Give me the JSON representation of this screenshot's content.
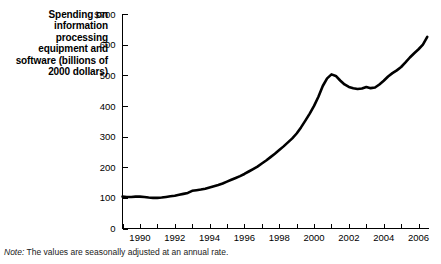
{
  "chart_title": "Spending on information processing equipment and software (billions of 2000 dollars)",
  "note": {
    "label": "Note:",
    "text": " The values are seasonally adjusted at an annual rate."
  },
  "colors": {
    "line": "#000000",
    "axis": "#000000",
    "background": "#ffffff"
  },
  "chart_data": {
    "type": "line",
    "title": "Spending on information processing equipment and software (billions of 2000 dollars)",
    "xlabel": "",
    "ylabel": "Spending on information processing equipment and software (billions of 2000 dollars)",
    "xlim": [
      1989.0,
      2006.6
    ],
    "ylim": [
      0,
      700
    ],
    "grid": false,
    "legend": null,
    "y_ticks": [
      0,
      100,
      200,
      300,
      400,
      500,
      600,
      700
    ],
    "y_tick_labels": [
      "0",
      "100",
      "200",
      "300",
      "400",
      "500",
      "600",
      "$700"
    ],
    "x_ticks": [
      1989,
      1990,
      1991,
      1992,
      1993,
      1994,
      1995,
      1996,
      1997,
      1998,
      1999,
      2000,
      2001,
      2002,
      2003,
      2004,
      2005,
      2006
    ],
    "x_tick_labels": [
      "",
      "1990",
      "",
      "1992",
      "",
      "1994",
      "",
      "1996",
      "",
      "1998",
      "",
      "2000",
      "",
      "2002",
      "",
      "2004",
      "",
      "2006"
    ],
    "series": [
      {
        "name": "Spending on information processing equipment and software",
        "x": [
          1989.0,
          1989.25,
          1989.5,
          1989.75,
          1990.0,
          1990.25,
          1990.5,
          1990.75,
          1991.0,
          1991.25,
          1991.5,
          1991.75,
          1992.0,
          1992.25,
          1992.5,
          1992.75,
          1993.0,
          1993.25,
          1993.5,
          1993.75,
          1994.0,
          1994.25,
          1994.5,
          1994.75,
          1995.0,
          1995.25,
          1995.5,
          1995.75,
          1996.0,
          1996.25,
          1996.5,
          1996.75,
          1997.0,
          1997.25,
          1997.5,
          1997.75,
          1998.0,
          1998.25,
          1998.5,
          1998.75,
          1999.0,
          1999.25,
          1999.5,
          1999.75,
          2000.0,
          2000.25,
          2000.5,
          2000.75,
          2001.0,
          2001.25,
          2001.5,
          2001.75,
          2002.0,
          2002.25,
          2002.5,
          2002.75,
          2003.0,
          2003.25,
          2003.5,
          2003.75,
          2004.0,
          2004.25,
          2004.5,
          2004.75,
          2005.0,
          2005.25,
          2005.5,
          2005.75,
          2006.0,
          2006.25,
          2006.5
        ],
        "y": [
          104,
          103,
          103,
          104,
          104,
          103,
          101,
          100,
          100,
          101,
          103,
          105,
          107,
          110,
          113,
          116,
          123,
          125,
          127,
          130,
          134,
          138,
          142,
          147,
          153,
          159,
          165,
          171,
          178,
          186,
          194,
          202,
          212,
          222,
          233,
          244,
          256,
          268,
          281,
          294,
          310,
          330,
          352,
          375,
          400,
          430,
          465,
          490,
          503,
          498,
          483,
          470,
          462,
          458,
          455,
          457,
          462,
          458,
          460,
          470,
          482,
          496,
          507,
          516,
          527,
          542,
          558,
          572,
          585,
          600,
          625
        ]
      }
    ]
  }
}
